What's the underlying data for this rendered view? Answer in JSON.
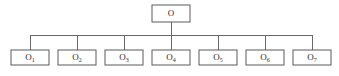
{
  "diagram": {
    "type": "tree",
    "title": "",
    "background_color": "#ffffff",
    "line_color": "#6a6a6a",
    "box_stroke_color": "#5a5a5a",
    "box_fill_color": "#ffffff",
    "text_color": "#2b2b2b",
    "root": {
      "label": "O",
      "base": "O",
      "subscript": "",
      "x": 171,
      "y": 13.5,
      "width": 38,
      "height": 17
    },
    "children": [
      {
        "label": "O1",
        "base": "O",
        "subscript": "1",
        "x": 30,
        "y": 57.5,
        "width": 38,
        "height": 15
      },
      {
        "label": "O2",
        "base": "O",
        "subscript": "2",
        "x": 77,
        "y": 57.5,
        "width": 38,
        "height": 15
      },
      {
        "label": "O3",
        "base": "O",
        "subscript": "3",
        "x": 124,
        "y": 57.5,
        "width": 38,
        "height": 15
      },
      {
        "label": "O4",
        "base": "O",
        "subscript": "4",
        "x": 171,
        "y": 57.5,
        "width": 38,
        "height": 15
      },
      {
        "label": "O5",
        "base": "O",
        "subscript": "5",
        "x": 218,
        "y": 57.5,
        "width": 38,
        "height": 15
      },
      {
        "label": "O6",
        "base": "O",
        "subscript": "6",
        "x": 265,
        "y": 57.5,
        "width": 38,
        "height": 15
      },
      {
        "label": "O7",
        "base": "O",
        "subscript": "7",
        "x": 312,
        "y": 57.5,
        "width": 38,
        "height": 15
      }
    ],
    "bus": {
      "y": 35,
      "x_start": 30,
      "x_end": 312,
      "root_stem_x": 171,
      "root_stem_top": 22,
      "child_stem_bottom": 50
    }
  }
}
